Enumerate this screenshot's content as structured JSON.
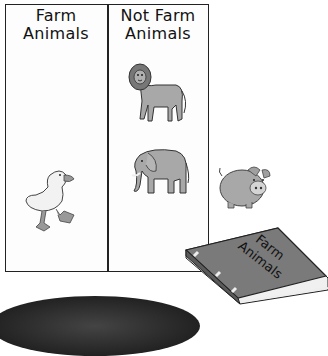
{
  "sorting_chart": {
    "columns": [
      {
        "header_line1": "Farm",
        "header_line2": "Animals",
        "animals": [
          "duck"
        ]
      },
      {
        "header_line1": "Not Farm",
        "header_line2": "Animals",
        "animals": [
          "lion",
          "elephant"
        ]
      }
    ]
  },
  "loose_animals": [
    "pig"
  ],
  "book": {
    "title_line1": "Farm",
    "title_line2": "Animals",
    "color": "#7a7a7a"
  },
  "colors": {
    "border": "#222222",
    "animal_gray": "#a0a0a0",
    "background": "#ffffff"
  }
}
